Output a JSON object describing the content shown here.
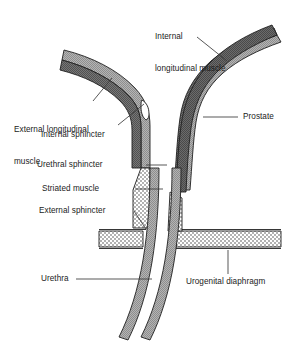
{
  "figure": {
    "type": "anatomical-diagram",
    "background_color": "#ffffff",
    "palette": {
      "outer_longitudinal_muscle": "#a8a8a8",
      "inner_dark_muscle": "#6e6e6e",
      "prostate": "#5f5f5f",
      "stipple_fill": "#ffffff",
      "stipple_dot": "#4a4a4a",
      "outline": "#1f1f1f",
      "leader_line": "#3a3a3a",
      "text": "#1b1b1b"
    }
  },
  "labels": {
    "internal_longitudinal_muscle": {
      "line1": "Internal",
      "line2": "longitudinal muscle"
    },
    "external_longitudinal_muscle": {
      "line1": "External longitudinal",
      "line2": "muscle"
    },
    "internal_sphincter": "Internal sphincter",
    "urethral_sphincter": "Urethral sphincter",
    "striated_muscle": "Striated muscle",
    "external_sphincter": "External sphincter",
    "urethra": "Urethra",
    "prostate": "Prostate",
    "urogenital_diaphragm": "Urogenital diaphragm"
  }
}
